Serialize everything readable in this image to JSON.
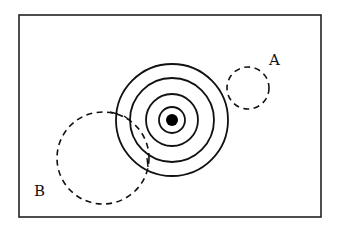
{
  "figure": {
    "frame": {
      "x": 19,
      "y": 15,
      "width": 302,
      "height": 202
    },
    "target": {
      "center": [
        172,
        120
      ],
      "rings": [
        56,
        42,
        26,
        13
      ],
      "dot_radius": 6
    },
    "circles": [
      {
        "id": "A",
        "label": "A",
        "center": [
          248,
          88
        ],
        "radius": 21,
        "style": "dashed",
        "label_pos": [
          275,
          65
        ]
      },
      {
        "id": "B",
        "label": "B",
        "center": [
          103,
          158
        ],
        "radius": 46,
        "style": "dashed",
        "label_pos": [
          40,
          196
        ]
      }
    ],
    "colors": {
      "stroke": "#111111",
      "background": "#ffffff"
    }
  }
}
